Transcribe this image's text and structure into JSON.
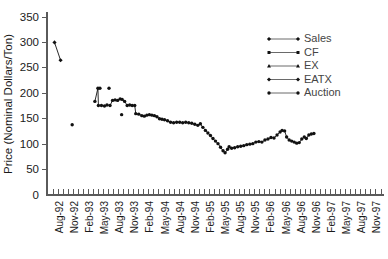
{
  "chart_data": {
    "type": "line",
    "title": "",
    "xlabel": "",
    "ylabel": "Price (Nominal Dollars/Ton)",
    "ylim": [
      0,
      375
    ],
    "yticks": [
      0,
      50,
      100,
      150,
      200,
      250,
      300,
      350
    ],
    "grid": false,
    "legend_position": "upper-right",
    "x_tick_labels": [
      "Aug-92",
      "Nov-92",
      "Feb-93",
      "May-93",
      "Aug-93",
      "Nov-93",
      "Feb-94",
      "May-94",
      "Aug-94",
      "Nov-94",
      "Feb-95",
      "May-95",
      "Aug-95",
      "Nov-95",
      "Feb-96",
      "May-96",
      "Aug-96",
      "Nov-96",
      "Feb-97",
      "May-97",
      "Aug-97",
      "Nov-97"
    ],
    "x_minor_tick_count": 66,
    "legend": [
      {
        "name": "Sales",
        "marker": "diamond",
        "color": "#111111"
      },
      {
        "name": "CF",
        "marker": "square",
        "color": "#111111"
      },
      {
        "name": "EX",
        "marker": "triangle",
        "color": "#111111"
      },
      {
        "name": "EATX",
        "marker": "diamond",
        "color": "#111111"
      },
      {
        "name": "Auction",
        "marker": "circle",
        "color": "#111111"
      }
    ],
    "series": [
      {
        "name": "Sales",
        "marker": "diamond",
        "connected": true,
        "points": [
          {
            "x": 0.3,
            "y": 300
          },
          {
            "x": 1.5,
            "y": 265
          }
        ]
      },
      {
        "name": "CF",
        "marker": "circle",
        "connected": false,
        "points": [
          {
            "x": 3.8,
            "y": 138
          }
        ]
      },
      {
        "name": "EX",
        "marker": "circle",
        "connected": false,
        "points": [
          {
            "x": 9.3,
            "y": 210
          },
          {
            "x": 13.6,
            "y": 158
          }
        ]
      },
      {
        "name": "EATX",
        "marker": "circle",
        "connected": false,
        "points": [
          {
            "x": 11.1,
            "y": 210
          }
        ]
      },
      {
        "name": "Auction",
        "marker": "circle",
        "connected": true,
        "points": [
          {
            "x": 8.3,
            "y": 184
          },
          {
            "x": 8.9,
            "y": 210
          },
          {
            "x": 9.0,
            "y": 176
          },
          {
            "x": 9.6,
            "y": 176
          },
          {
            "x": 10.2,
            "y": 175
          },
          {
            "x": 10.7,
            "y": 177
          },
          {
            "x": 11.3,
            "y": 176
          },
          {
            "x": 11.8,
            "y": 186
          },
          {
            "x": 12.3,
            "y": 187
          },
          {
            "x": 12.8,
            "y": 186
          },
          {
            "x": 13.3,
            "y": 189
          },
          {
            "x": 13.7,
            "y": 188
          },
          {
            "x": 14.2,
            "y": 184
          },
          {
            "x": 14.7,
            "y": 176
          },
          {
            "x": 15.2,
            "y": 177
          },
          {
            "x": 15.7,
            "y": 176
          },
          {
            "x": 16.2,
            "y": 176
          },
          {
            "x": 16.4,
            "y": 160
          },
          {
            "x": 17.0,
            "y": 159
          },
          {
            "x": 17.6,
            "y": 156
          },
          {
            "x": 18.1,
            "y": 155
          },
          {
            "x": 18.6,
            "y": 157
          },
          {
            "x": 19.1,
            "y": 158
          },
          {
            "x": 19.6,
            "y": 157
          },
          {
            "x": 20.1,
            "y": 156
          },
          {
            "x": 20.6,
            "y": 154
          },
          {
            "x": 21.1,
            "y": 150
          },
          {
            "x": 21.6,
            "y": 149
          },
          {
            "x": 22.1,
            "y": 148
          },
          {
            "x": 22.7,
            "y": 146
          },
          {
            "x": 23.3,
            "y": 143
          },
          {
            "x": 23.9,
            "y": 142
          },
          {
            "x": 24.5,
            "y": 143
          },
          {
            "x": 25.1,
            "y": 143
          },
          {
            "x": 25.7,
            "y": 142
          },
          {
            "x": 26.3,
            "y": 143
          },
          {
            "x": 26.9,
            "y": 142
          },
          {
            "x": 27.5,
            "y": 141
          },
          {
            "x": 28.1,
            "y": 139
          },
          {
            "x": 28.7,
            "y": 137
          },
          {
            "x": 29.2,
            "y": 140
          },
          {
            "x": 29.7,
            "y": 133
          },
          {
            "x": 30.2,
            "y": 127
          },
          {
            "x": 30.7,
            "y": 122
          },
          {
            "x": 31.2,
            "y": 117
          },
          {
            "x": 31.7,
            "y": 111
          },
          {
            "x": 32.2,
            "y": 106
          },
          {
            "x": 32.7,
            "y": 101
          },
          {
            "x": 33.2,
            "y": 94
          },
          {
            "x": 33.7,
            "y": 87
          },
          {
            "x": 34.1,
            "y": 83
          },
          {
            "x": 34.6,
            "y": 90
          },
          {
            "x": 34.9,
            "y": 95
          },
          {
            "x": 35.4,
            "y": 92
          },
          {
            "x": 36.0,
            "y": 93
          },
          {
            "x": 36.6,
            "y": 95
          },
          {
            "x": 37.2,
            "y": 96
          },
          {
            "x": 37.8,
            "y": 97
          },
          {
            "x": 38.4,
            "y": 99
          },
          {
            "x": 39.0,
            "y": 100
          },
          {
            "x": 39.6,
            "y": 101
          },
          {
            "x": 40.2,
            "y": 104
          },
          {
            "x": 40.8,
            "y": 105
          },
          {
            "x": 41.4,
            "y": 104
          },
          {
            "x": 42.0,
            "y": 108
          },
          {
            "x": 42.6,
            "y": 110
          },
          {
            "x": 43.2,
            "y": 113
          },
          {
            "x": 43.8,
            "y": 112
          },
          {
            "x": 44.4,
            "y": 118
          },
          {
            "x": 45.0,
            "y": 124
          },
          {
            "x": 45.4,
            "y": 127
          },
          {
            "x": 45.9,
            "y": 126
          },
          {
            "x": 46.3,
            "y": 114
          },
          {
            "x": 46.8,
            "y": 108
          },
          {
            "x": 47.3,
            "y": 106
          },
          {
            "x": 47.8,
            "y": 104
          },
          {
            "x": 48.3,
            "y": 102
          },
          {
            "x": 48.8,
            "y": 103
          },
          {
            "x": 49.3,
            "y": 110
          },
          {
            "x": 49.8,
            "y": 114
          },
          {
            "x": 50.2,
            "y": 111
          },
          {
            "x": 50.7,
            "y": 118
          },
          {
            "x": 51.2,
            "y": 120
          },
          {
            "x": 51.7,
            "y": 121
          }
        ]
      }
    ]
  }
}
